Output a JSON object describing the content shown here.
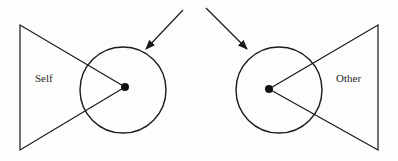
{
  "diagram": {
    "type": "self-other perspective diagram",
    "stroke_color": "#1a1a1a",
    "background": "#fdfdfc",
    "left": {
      "label": "Self",
      "circle": {
        "cx": 123,
        "cy": 90,
        "r": 43
      },
      "dot": {
        "cx": 125,
        "cy": 87,
        "r": 4
      },
      "triangle": [
        [
          20,
          25
        ],
        [
          20,
          150
        ],
        [
          125,
          87
        ]
      ],
      "arrow": {
        "from": [
          183,
          10
        ],
        "to": [
          146,
          49
        ]
      }
    },
    "right": {
      "label": "Other",
      "circle": {
        "cx": 279,
        "cy": 90,
        "r": 43
      },
      "dot": {
        "cx": 269,
        "cy": 89,
        "r": 4
      },
      "triangle": [
        [
          378,
          25
        ],
        [
          378,
          150
        ],
        [
          269,
          89
        ]
      ],
      "arrow": {
        "from": [
          206,
          8
        ],
        "to": [
          247,
          49
        ]
      }
    }
  }
}
